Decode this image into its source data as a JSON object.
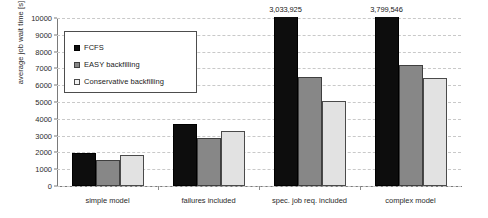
{
  "chart_data": {
    "type": "bar",
    "title": "",
    "xlabel": "",
    "ylabel": "average job wait time [s]",
    "ylim": [
      0,
      10000
    ],
    "ytick_step": 1000,
    "yticks": [
      "0",
      "1000",
      "2000",
      "3000",
      "4000",
      "5000",
      "6000",
      "7000",
      "8000",
      "9000",
      "10000"
    ],
    "grid": true,
    "legend_position": "inside-top-left",
    "categories": [
      "simple model",
      "failures included",
      "spec. job req. included",
      "complex model"
    ],
    "series": [
      {
        "name": "FCFS",
        "color": "#0d0d0d",
        "values": [
          1950,
          3680,
          3033925,
          3799546
        ],
        "clipped": [
          false,
          false,
          true,
          true
        ],
        "data_labels": [
          "",
          "",
          "3,033,925",
          "3,799,546"
        ]
      },
      {
        "name": "EASY backfilling",
        "color": "#878787",
        "values": [
          1560,
          2880,
          6480,
          7200
        ],
        "clipped": [
          false,
          false,
          false,
          false
        ],
        "data_labels": [
          "",
          "",
          "",
          ""
        ]
      },
      {
        "name": "Conservative backfilling",
        "color": "#e2e2e2",
        "values": [
          1830,
          3250,
          5050,
          6400
        ],
        "clipped": [
          false,
          false,
          false,
          false
        ],
        "data_labels": [
          "",
          "",
          "",
          ""
        ]
      }
    ]
  },
  "legend": {
    "items": [
      {
        "label": "FCFS"
      },
      {
        "label": "EASY backfilling"
      },
      {
        "label": "Conservative backfilling"
      }
    ]
  }
}
